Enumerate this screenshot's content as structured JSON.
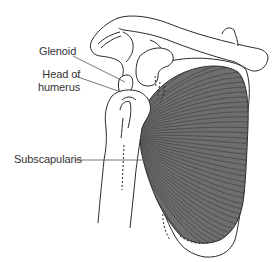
{
  "figure": {
    "type": "anatomical-illustration",
    "labels": [
      {
        "id": "glenoid",
        "text": "Glenoid"
      },
      {
        "id": "head_of_humerus",
        "lines": [
          "Head of",
          "humerus"
        ]
      },
      {
        "id": "subscapularis",
        "text": "Subscapularis"
      }
    ],
    "structures": [
      "clavicle-icon",
      "acromion-icon",
      "coracoid-process-icon",
      "scapula-icon",
      "humerus-icon",
      "subscapularis-muscle-icon"
    ],
    "colors": {
      "line": "#2b2b2b",
      "muscle_fill": "#6e6e6e",
      "muscle_fiber": "#3a3a3a",
      "leader": "#555555",
      "background": "#ffffff"
    }
  }
}
